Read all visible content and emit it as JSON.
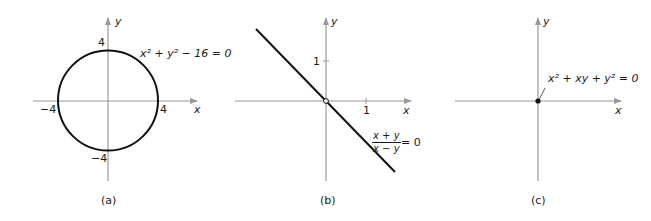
{
  "panels": [
    {
      "id": "a",
      "caption": "(a)",
      "equation": "x² + y² − 16 = 0",
      "x_axis_label": "x",
      "y_axis_label": "y",
      "ticks": {
        "x_pos": "4",
        "x_neg": "−4",
        "y_pos": "4",
        "y_neg": "−4"
      },
      "graph": "circle of radius 4 centered at origin"
    },
    {
      "id": "b",
      "caption": "(b)",
      "equation_numerator": "x + y",
      "equation_denominator": "x − y",
      "equation_rhs": "= 0",
      "x_axis_label": "x",
      "y_axis_label": "y",
      "ticks": {
        "x": "1",
        "y": "1"
      },
      "graph": "line y = −x with open point at origin"
    },
    {
      "id": "c",
      "caption": "(c)",
      "equation": "x² + xy + y² = 0",
      "x_axis_label": "x",
      "y_axis_label": "y",
      "graph": "single point at origin"
    }
  ],
  "colors": {
    "axis": "#9a9a9a",
    "curve": "#111111"
  }
}
